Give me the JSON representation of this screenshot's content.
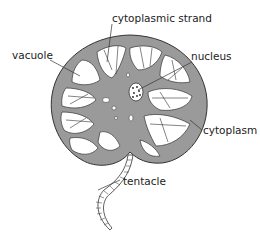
{
  "diagram": {
    "colors": {
      "cytoplasm": "#9a9a9a",
      "vacuole": "#ffffff",
      "outline": "#333333"
    },
    "labels": {
      "cytoplasmic_strand": "cytoplasmic strand",
      "vacuole": "vacuole",
      "nucleus": "nucleus",
      "cytoplasm": "cytoplasm",
      "tentacle": "tentacle"
    }
  }
}
